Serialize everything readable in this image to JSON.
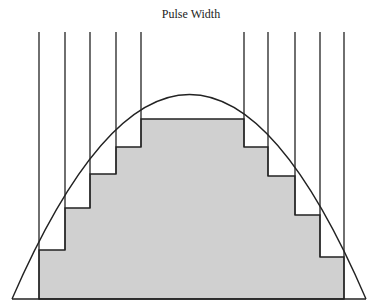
{
  "title": "Pulse Width",
  "colors": {
    "fill": "#d0d0d0",
    "stroke": "#222222",
    "background": "#ffffff"
  },
  "diagram": {
    "type": "sinusoidal-pwm-staircase",
    "baseline_y": 299,
    "curve": {
      "start_x": 12,
      "end_x": 366,
      "peak_x": 192,
      "peak_y": 96
    },
    "pulse_lines": [
      {
        "x": 39,
        "top": 32,
        "level_y": 250
      },
      {
        "x": 65,
        "top": 32,
        "level_y": 208
      },
      {
        "x": 90,
        "top": 32,
        "level_y": 174
      },
      {
        "x": 116,
        "top": 32,
        "level_y": 147
      },
      {
        "x": 141,
        "top": 32,
        "level_y": 119
      },
      {
        "x": 244,
        "top": 32,
        "level_y": 119
      },
      {
        "x": 268,
        "top": 32,
        "level_y": 174
      },
      {
        "x": 295,
        "top": 32,
        "level_y": 215
      },
      {
        "x": 320,
        "top": 32,
        "level_y": 257
      },
      {
        "x": 344,
        "top": 32,
        "level_y": 299
      }
    ]
  }
}
